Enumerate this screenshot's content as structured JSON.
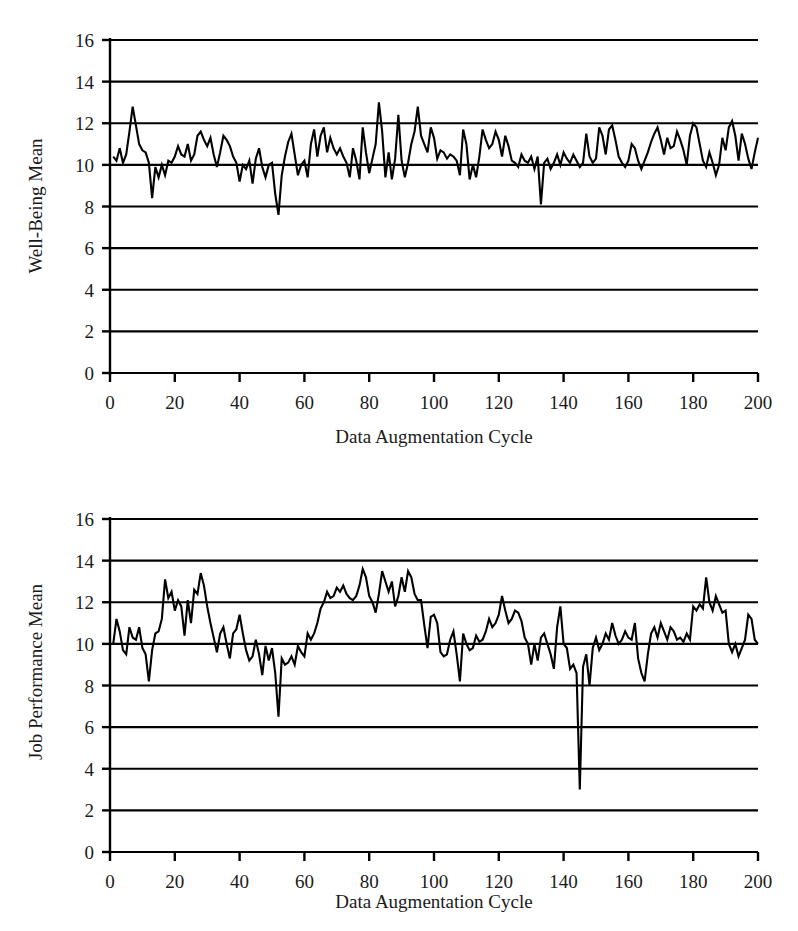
{
  "figure": {
    "background_color": "#ffffff",
    "line_color": "#000000",
    "axis_color": "#000000"
  },
  "charts": [
    {
      "id": "well-being",
      "ylabel": "Well-Being Mean",
      "xlabel": "Data Augmentation Cycle",
      "ytick_labels": [
        "0",
        "2",
        "4",
        "6",
        "8",
        "10",
        "12",
        "14",
        "16"
      ],
      "xtick_labels": [
        "0",
        "20",
        "40",
        "60",
        "80",
        "100",
        "120",
        "140",
        "160",
        "180",
        "200"
      ]
    },
    {
      "id": "job-performance",
      "ylabel": "Job Performance Mean",
      "xlabel": "Data Augmentation Cycle",
      "ytick_labels": [
        "0",
        "2",
        "4",
        "6",
        "8",
        "10",
        "12",
        "14",
        "16"
      ],
      "xtick_labels": [
        "0",
        "20",
        "40",
        "60",
        "80",
        "100",
        "120",
        "140",
        "160",
        "180",
        "200"
      ]
    }
  ],
  "chart_data": [
    {
      "type": "line",
      "title": "",
      "xlabel": "Data Augmentation Cycle",
      "ylabel": "Well-Being Mean",
      "xlim": [
        0,
        200
      ],
      "ylim": [
        0,
        16
      ],
      "yticks": [
        0,
        2,
        4,
        6,
        8,
        10,
        12,
        14,
        16
      ],
      "xticks": [
        0,
        20,
        40,
        60,
        80,
        100,
        120,
        140,
        160,
        180,
        200
      ],
      "grid": "horizontal",
      "legend": "none",
      "series": [
        {
          "name": "Well-Being Mean",
          "x_start": 1,
          "x_step": 1,
          "values": [
            10.4,
            10.2,
            10.8,
            10.1,
            10.5,
            11.6,
            12.8,
            11.9,
            11.0,
            10.7,
            10.6,
            10.1,
            8.4,
            9.9,
            9.4,
            10.0,
            9.5,
            10.2,
            10.1,
            10.4,
            10.9,
            10.5,
            10.4,
            11.0,
            10.2,
            10.5,
            11.4,
            11.6,
            11.2,
            10.9,
            11.3,
            10.5,
            9.9,
            10.6,
            11.4,
            11.2,
            10.9,
            10.4,
            10.1,
            9.2,
            10.0,
            9.8,
            10.2,
            9.1,
            10.3,
            10.8,
            9.9,
            9.4,
            10.0,
            10.1,
            8.6,
            7.6,
            9.5,
            10.4,
            11.1,
            11.5,
            10.5,
            9.5,
            10.0,
            10.2,
            9.4,
            11.0,
            11.7,
            10.4,
            11.4,
            11.8,
            10.6,
            11.3,
            10.8,
            10.5,
            10.8,
            10.4,
            10.1,
            9.4,
            10.8,
            10.2,
            9.3,
            11.8,
            10.6,
            9.6,
            10.3,
            11.0,
            13.0,
            11.6,
            9.4,
            10.6,
            9.3,
            10.3,
            12.4,
            10.2,
            9.4,
            10.1,
            11.0,
            11.6,
            12.8,
            11.4,
            11.0,
            10.6,
            11.8,
            11.3,
            10.3,
            10.7,
            10.6,
            10.3,
            10.5,
            10.4,
            10.2,
            9.5,
            11.7,
            11.0,
            9.3,
            10.0,
            9.4,
            10.4,
            11.7,
            11.2,
            10.8,
            11.0,
            11.6,
            11.2,
            10.4,
            11.4,
            10.9,
            10.2,
            10.1,
            9.9,
            10.5,
            10.2,
            10.1,
            10.4,
            9.8,
            10.4,
            8.1,
            10.1,
            10.3,
            9.8,
            10.1,
            10.5,
            10.0,
            10.6,
            10.3,
            10.1,
            10.5,
            10.2,
            9.9,
            10.1,
            11.5,
            10.4,
            10.1,
            10.3,
            11.8,
            11.4,
            10.5,
            11.7,
            11.9,
            11.2,
            10.4,
            10.1,
            9.9,
            10.2,
            11.0,
            10.8,
            10.2,
            9.8,
            10.2,
            10.6,
            11.1,
            11.5,
            11.8,
            11.2,
            10.5,
            11.3,
            10.8,
            10.9,
            11.6,
            11.2,
            10.7,
            10.0,
            11.4,
            12.0,
            11.8,
            11.0,
            10.2,
            9.9,
            10.6,
            10.1,
            9.5,
            10.0,
            11.3,
            10.7,
            11.8,
            12.1,
            11.4,
            10.2,
            11.5,
            11.0,
            10.3,
            9.8,
            10.6,
            11.3
          ]
        }
      ]
    },
    {
      "type": "line",
      "title": "",
      "xlabel": "Data Augmentation Cycle",
      "ylabel": "Job Performance Mean",
      "xlim": [
        0,
        200
      ],
      "ylim": [
        0,
        16
      ],
      "yticks": [
        0,
        2,
        4,
        6,
        8,
        10,
        12,
        14,
        16
      ],
      "xticks": [
        0,
        20,
        40,
        60,
        80,
        100,
        120,
        140,
        160,
        180,
        200
      ],
      "grid": "horizontal",
      "legend": "none",
      "series": [
        {
          "name": "Job Performance Mean",
          "x_start": 1,
          "x_step": 1,
          "values": [
            10.0,
            11.2,
            10.6,
            9.7,
            9.5,
            10.8,
            10.3,
            10.2,
            10.8,
            9.8,
            9.5,
            8.2,
            9.7,
            10.5,
            10.6,
            11.2,
            13.1,
            12.2,
            12.5,
            11.6,
            12.1,
            11.8,
            10.4,
            12.1,
            11.0,
            12.6,
            12.4,
            13.4,
            12.8,
            11.8,
            11.0,
            10.3,
            9.6,
            10.5,
            10.8,
            10.0,
            9.3,
            10.5,
            10.7,
            11.4,
            10.5,
            9.7,
            9.2,
            9.4,
            10.2,
            9.5,
            8.5,
            9.9,
            9.2,
            9.8,
            8.6,
            6.5,
            9.3,
            9.0,
            9.1,
            9.4,
            9.0,
            9.9,
            9.6,
            9.4,
            10.5,
            10.2,
            10.5,
            11.0,
            11.7,
            12.0,
            12.5,
            12.2,
            12.3,
            12.7,
            12.5,
            12.8,
            12.4,
            12.2,
            12.1,
            12.3,
            12.8,
            13.6,
            13.2,
            12.3,
            12.0,
            11.5,
            12.4,
            13.5,
            13.0,
            12.5,
            13.0,
            11.8,
            12.3,
            13.2,
            12.5,
            13.5,
            13.2,
            12.4,
            12.1,
            12.1,
            10.9,
            9.8,
            11.3,
            11.4,
            11.0,
            9.6,
            9.4,
            9.5,
            10.2,
            10.6,
            9.5,
            8.2,
            10.5,
            10.0,
            9.7,
            9.8,
            10.4,
            10.1,
            10.2,
            10.6,
            11.2,
            10.8,
            11.0,
            11.4,
            12.3,
            11.6,
            11.0,
            11.2,
            11.6,
            11.5,
            11.1,
            10.3,
            10.0,
            9.0,
            10.0,
            9.2,
            10.3,
            10.5,
            10.0,
            9.5,
            8.8,
            10.8,
            11.8,
            10.0,
            9.8,
            8.8,
            9.0,
            8.6,
            3.0,
            8.9,
            9.5,
            8.0,
            9.8,
            10.3,
            9.7,
            10.0,
            10.5,
            10.2,
            11.0,
            10.4,
            10.0,
            10.2,
            10.6,
            10.3,
            10.2,
            11.0,
            9.3,
            8.6,
            8.2,
            9.5,
            10.5,
            10.8,
            10.3,
            11.0,
            10.6,
            10.2,
            10.8,
            10.6,
            10.2,
            10.3,
            10.1,
            10.5,
            10.2,
            11.8,
            11.6,
            11.9,
            11.7,
            13.2,
            12.0,
            11.6,
            12.3,
            11.9,
            11.5,
            11.6,
            10.0,
            9.6,
            10.0,
            9.4,
            9.8,
            10.2,
            11.4,
            11.2,
            10.2,
            10.0
          ]
        }
      ]
    }
  ]
}
